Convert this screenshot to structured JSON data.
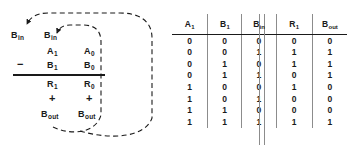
{
  "diagram": {
    "borrow_in_left": {
      "base": "B",
      "sub": "in"
    },
    "borrow_in_right": {
      "base": "B",
      "sub": "in"
    },
    "minuend_high": {
      "base": "A",
      "sub": "1"
    },
    "minuend_low": {
      "base": "A",
      "sub": "0"
    },
    "subtrahend_high": {
      "base": "B",
      "sub": "1"
    },
    "subtrahend_low": {
      "base": "B",
      "sub": "0"
    },
    "result_high": {
      "base": "R",
      "sub": "1"
    },
    "result_low": {
      "base": "R",
      "sub": "0"
    },
    "borrow_out_high": {
      "base": "B",
      "sub": "out"
    },
    "borrow_out_low": {
      "base": "B",
      "sub": "out"
    },
    "minus_sign": "−",
    "plus_sign_high": "+",
    "plus_sign_low": "+",
    "line_color": "#1a1a1a",
    "loop_style": "dashed"
  },
  "table": {
    "headers": [
      {
        "base": "A",
        "sub": "1"
      },
      {
        "base": "B",
        "sub": "1"
      },
      {
        "base": "B",
        "sub": "in"
      },
      {
        "base": "R",
        "sub": "1"
      },
      {
        "base": "B",
        "sub": "out"
      }
    ],
    "rows": [
      [
        "0",
        "0",
        "0",
        "0",
        "0"
      ],
      [
        "0",
        "0",
        "1",
        "1",
        "1"
      ],
      [
        "0",
        "1",
        "0",
        "1",
        "1"
      ],
      [
        "0",
        "1",
        "1",
        "0",
        "1"
      ],
      [
        "1",
        "0",
        "0",
        "1",
        "0"
      ],
      [
        "1",
        "0",
        "1",
        "0",
        "0"
      ],
      [
        "1",
        "1",
        "0",
        "0",
        "0"
      ],
      [
        "1",
        "1",
        "1",
        "1",
        "1"
      ]
    ],
    "rule_color": "#8c8c8c",
    "header_rule_color": "#1a1a1a"
  }
}
